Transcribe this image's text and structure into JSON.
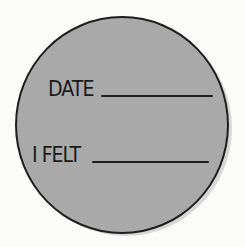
{
  "label_card": {
    "fields": [
      {
        "label": "DATE",
        "value": ""
      },
      {
        "label": "I FELT",
        "value": ""
      }
    ],
    "colors": {
      "fill": "#a9a9a9",
      "outline": "#1e1e1e",
      "background": "#fbfbfa"
    }
  }
}
